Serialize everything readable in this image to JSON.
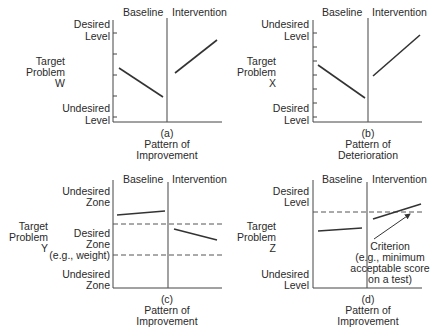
{
  "panels": [
    {
      "id": "a",
      "phase_labels": {
        "baseline": "Baseline",
        "intervention": "Intervention"
      },
      "y_label": [
        "Target",
        "Problem",
        "W"
      ],
      "top_label": [
        "Desired",
        "Level"
      ],
      "bottom_label": [
        "Undesired",
        "Level"
      ],
      "caption": [
        "(a)",
        "Pattern of",
        "Improvement"
      ]
    },
    {
      "id": "b",
      "phase_labels": {
        "baseline": "Baseline",
        "intervention": "Intervention"
      },
      "y_label": [
        "Target",
        "Problem",
        "X"
      ],
      "top_label": [
        "Undesired",
        "Level"
      ],
      "bottom_label": [
        "Desired",
        "Level"
      ],
      "caption": [
        "(b)",
        "Pattern of",
        "Deterioration"
      ]
    },
    {
      "id": "c",
      "phase_labels": {
        "baseline": "Baseline",
        "intervention": "Intervention"
      },
      "y_label": [
        "Target",
        "Problem",
        "Y"
      ],
      "top_label": [
        "Undesired",
        "Zone"
      ],
      "middle_label": [
        "Desired",
        "Zone",
        "(e.g., weight)"
      ],
      "bottom_label": [
        "Undesired",
        "Zone"
      ],
      "caption": [
        "(c)",
        "Pattern of",
        "Improvement"
      ]
    },
    {
      "id": "d",
      "phase_labels": {
        "baseline": "Baseline",
        "intervention": "Intervention"
      },
      "y_label": [
        "Target",
        "Problem",
        "Z"
      ],
      "top_label": [
        "Desired",
        "Level"
      ],
      "bottom_label": [
        "Undesired",
        "Level"
      ],
      "annotation": [
        "Criterion",
        "(e.g., minimum",
        "acceptable score",
        "on a test)"
      ],
      "caption": [
        "(d)",
        "Pattern of",
        "Improvement"
      ]
    }
  ]
}
